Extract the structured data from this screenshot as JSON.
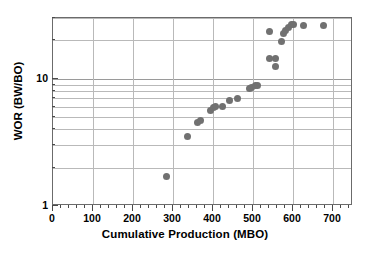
{
  "chart_data": {
    "type": "scatter",
    "title": "",
    "xlabel": "Cumulative Production (MBO)",
    "ylabel": "WOR (BW/BO)",
    "xlim": [
      0,
      750
    ],
    "ylim": [
      1,
      30
    ],
    "xscale": "linear",
    "yscale": "log",
    "grid": true,
    "legend": "none",
    "marker_color": "#717171",
    "frame_color": "#6b6b6b",
    "grid_color": "#b9b9b9",
    "xticks": [
      0,
      100,
      200,
      300,
      400,
      500,
      600,
      700
    ],
    "xticklabels": [
      "0",
      "100",
      "200",
      "300",
      "400",
      "500",
      "600",
      "700"
    ],
    "xminor_step": 20,
    "yticks": [
      1,
      10
    ],
    "yticklabels": [
      "1",
      "10"
    ],
    "yminorticks": [
      2,
      3,
      4,
      5,
      6,
      7,
      8,
      9,
      20,
      30
    ],
    "series": [
      {
        "name": "WOR",
        "points": [
          {
            "x": 283,
            "y": 1.7
          },
          {
            "x": 337,
            "y": 3.5
          },
          {
            "x": 362,
            "y": 4.5
          },
          {
            "x": 368,
            "y": 4.7
          },
          {
            "x": 393,
            "y": 5.6
          },
          {
            "x": 401,
            "y": 6.0
          },
          {
            "x": 407,
            "y": 6.1
          },
          {
            "x": 423,
            "y": 6.1
          },
          {
            "x": 440,
            "y": 6.7
          },
          {
            "x": 462,
            "y": 7.0
          },
          {
            "x": 492,
            "y": 8.4
          },
          {
            "x": 497,
            "y": 8.6
          },
          {
            "x": 505,
            "y": 8.8
          },
          {
            "x": 510,
            "y": 8.8
          },
          {
            "x": 540,
            "y": 14.5
          },
          {
            "x": 541,
            "y": 23.5
          },
          {
            "x": 556,
            "y": 14.5
          },
          {
            "x": 556,
            "y": 12.6
          },
          {
            "x": 570,
            "y": 19.5
          },
          {
            "x": 576,
            "y": 22.5
          },
          {
            "x": 581,
            "y": 24.0
          },
          {
            "x": 589,
            "y": 25.5
          },
          {
            "x": 595,
            "y": 26.5
          },
          {
            "x": 600,
            "y": 26.5
          },
          {
            "x": 626,
            "y": 26.0
          },
          {
            "x": 675,
            "y": 26.0
          }
        ]
      }
    ]
  },
  "axes": {
    "x_title": "Cumulative Production (MBO)",
    "y_title": "WOR (BW/BO)"
  }
}
